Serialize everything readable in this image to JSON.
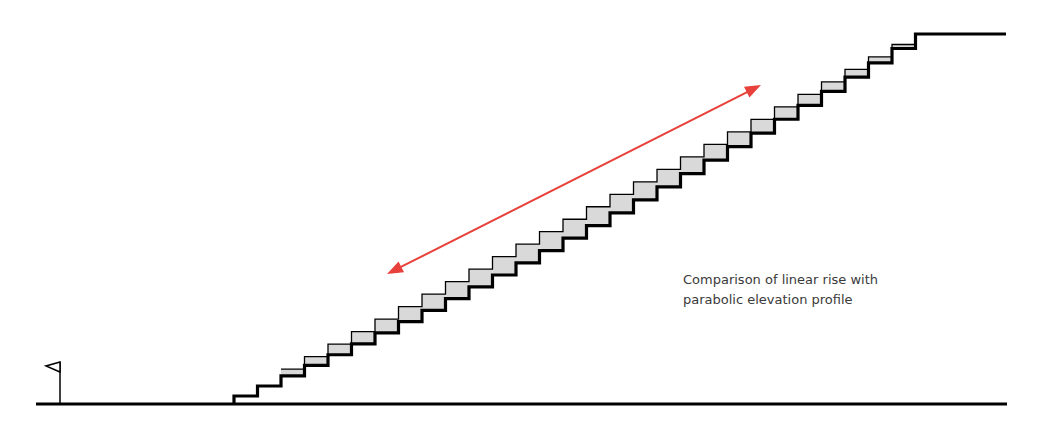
{
  "caption": {
    "line1": "Comparison of linear rise with",
    "line2": "parabolic elevation profile"
  },
  "colors": {
    "ink": "#000000",
    "fill": "#d9d9d9",
    "arrow": "#e8403a",
    "text": "#3a3a3a",
    "background": "#ffffff"
  },
  "ground": {
    "x1": 36,
    "x2": 1007,
    "y": 404
  },
  "flag": {
    "x": 60,
    "top": 362,
    "flag_left": 46,
    "flag_bottom": 372
  },
  "staircase": {
    "start_x": 234,
    "start_y": 404,
    "end_x": 939,
    "end_y": 34,
    "steps": 30,
    "first_riser": 8,
    "parabolic_sag": 15,
    "top_landing_end_x": 1006
  },
  "arrow": {
    "x1": 387,
    "y1": 274,
    "x2": 761,
    "y2": 85
  }
}
